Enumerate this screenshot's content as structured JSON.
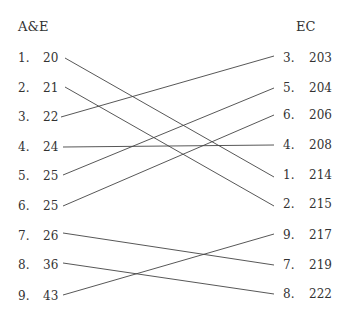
{
  "left": {
    "title": "A&E",
    "rows": [
      {
        "rank": "1.",
        "value": "20"
      },
      {
        "rank": "2.",
        "value": "21"
      },
      {
        "rank": "3.",
        "value": "22"
      },
      {
        "rank": "4.",
        "value": "24"
      },
      {
        "rank": "5.",
        "value": "25"
      },
      {
        "rank": "6.",
        "value": "25"
      },
      {
        "rank": "7.",
        "value": "26"
      },
      {
        "rank": "8.",
        "value": "36"
      },
      {
        "rank": "9.",
        "value": "43"
      }
    ]
  },
  "right": {
    "title": "EC",
    "rows": [
      {
        "rank": "3.",
        "value": "203"
      },
      {
        "rank": "5.",
        "value": "204"
      },
      {
        "rank": "6.",
        "value": "206"
      },
      {
        "rank": "4.",
        "value": "208"
      },
      {
        "rank": "1.",
        "value": "214"
      },
      {
        "rank": "2.",
        "value": "215"
      },
      {
        "rank": "9.",
        "value": "217"
      },
      {
        "rank": "7.",
        "value": "219"
      },
      {
        "rank": "8.",
        "value": "222"
      }
    ]
  },
  "links": [
    {
      "from_rank": "1",
      "to_rank": "1"
    },
    {
      "from_rank": "2",
      "to_rank": "2"
    },
    {
      "from_rank": "3",
      "to_rank": "3"
    },
    {
      "from_rank": "4",
      "to_rank": "4"
    },
    {
      "from_rank": "5",
      "to_rank": "5"
    },
    {
      "from_rank": "6",
      "to_rank": "6"
    },
    {
      "from_rank": "7",
      "to_rank": "7"
    },
    {
      "from_rank": "8",
      "to_rank": "8"
    },
    {
      "from_rank": "9",
      "to_rank": "9"
    }
  ],
  "colors": {
    "text": "#333333",
    "line": "#444444"
  }
}
